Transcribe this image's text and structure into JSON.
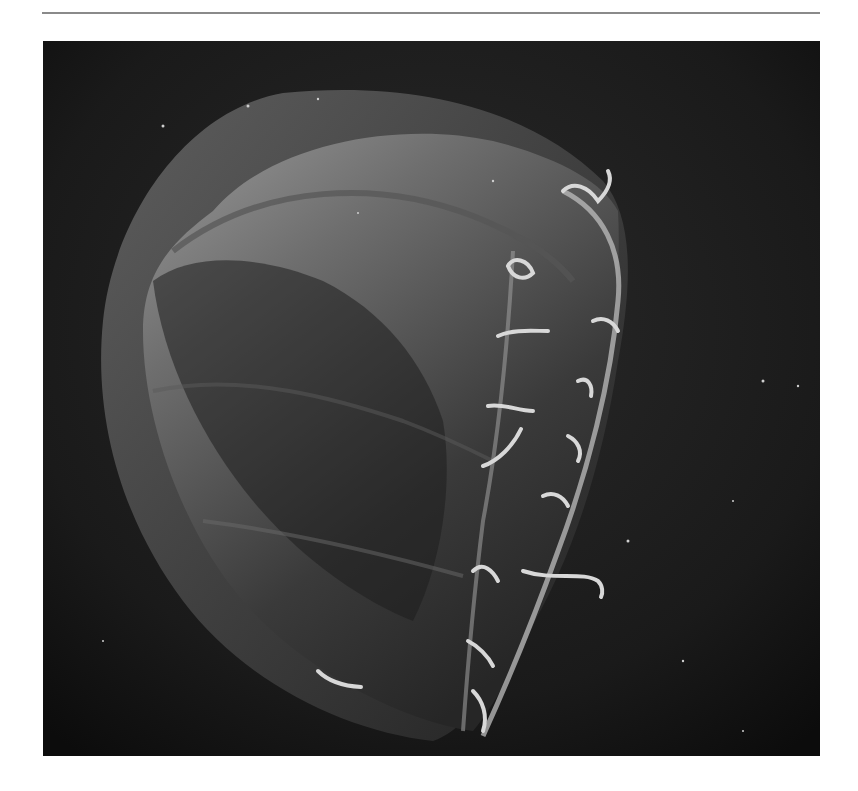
{
  "page": {
    "background": "#ffffff",
    "rule_color": "#8a8a8a"
  },
  "photo": {
    "subject": "jellyfish",
    "style": "grayscale photograph",
    "background_color": "#1a1a1a",
    "bell_outer_color": "#5a5a5a",
    "bell_inner_color": "#7a7a7a",
    "tentacle_color": "#d8d8d8"
  }
}
